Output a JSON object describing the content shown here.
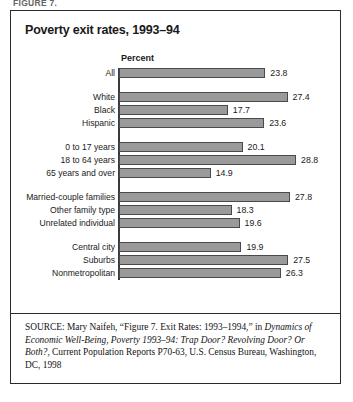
{
  "figure_caption": "FIGURE 7.",
  "chart_title": "Poverty exit rates, 1993–94",
  "axis_title": "Percent",
  "source": {
    "prefix": "SOURCE:",
    "part1": " Mary Naifeh, “Figure 7. Exit Rates: 1993–1994,” in ",
    "italic1": "Dynamics of Economic Well-Being, Poverty 1993–94: Trap Door? Revolving Door? Or Both?",
    "part2": ", Current Population Reports P70-63, U.S. Census Bureau, Washington, DC, 1998"
  },
  "chart_data": {
    "type": "bar",
    "orientation": "horizontal",
    "title": "Poverty exit rates, 1993–94",
    "xlabel": "Percent",
    "ylabel": "",
    "xlim": [
      0,
      30
    ],
    "grid": false,
    "legend": false,
    "categories": [
      "All",
      "White",
      "Black",
      "Hispanic",
      "0 to 17 years",
      "18 to 64 years",
      "65 years and over",
      "Married-couple families",
      "Other family type",
      "Unrelated individual",
      "Central city",
      "Suburbs",
      "Nonmetropolitan"
    ],
    "values": [
      23.8,
      27.4,
      17.7,
      23.6,
      20.1,
      28.8,
      14.9,
      27.8,
      18.3,
      19.6,
      19.9,
      27.5,
      26.3
    ],
    "groups": [
      {
        "name": "total",
        "categories": [
          "All"
        ],
        "values": [
          23.8
        ]
      },
      {
        "name": "race-ethnicity",
        "categories": [
          "White",
          "Black",
          "Hispanic"
        ],
        "values": [
          27.4,
          17.7,
          23.6
        ]
      },
      {
        "name": "age",
        "categories": [
          "0 to 17 years",
          "18 to 64 years",
          "65 years and over"
        ],
        "values": [
          20.1,
          28.8,
          14.9
        ]
      },
      {
        "name": "family-type",
        "categories": [
          "Married-couple families",
          "Other family type",
          "Unrelated individual"
        ],
        "values": [
          27.8,
          18.3,
          19.6
        ]
      },
      {
        "name": "residence",
        "categories": [
          "Central city",
          "Suburbs",
          "Nonmetropolitan"
        ],
        "values": [
          19.9,
          27.5,
          26.3
        ]
      }
    ],
    "bar_color": "#9a9a9a",
    "bar_border_color": "#4a4a4a"
  }
}
